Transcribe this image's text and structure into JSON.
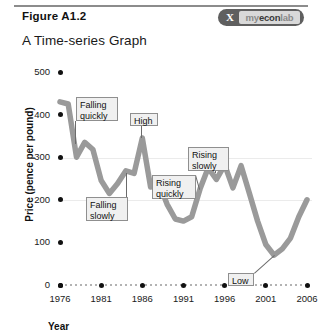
{
  "header": {
    "figure_label": "Figure A1.2",
    "title": "A Time-series Graph",
    "logo_mark": "X",
    "logo_text_a": "my",
    "logo_text_b": "econ",
    "logo_text_c": "lab"
  },
  "colors": {
    "line": "#9a9a9a",
    "callout_bg": "#f0f0f0",
    "callout_border": "#8f8f8f",
    "tick": "#111111",
    "logo_pill": "#5f5f5f"
  },
  "chart_data": {
    "type": "line",
    "title": "A Time-series Graph",
    "xlabel": "Year",
    "ylabel": "Price (pence per pound)",
    "xlim": [
      1976,
      2006
    ],
    "ylim": [
      0,
      500
    ],
    "xticks": [
      1976,
      1981,
      1986,
      1991,
      1996,
      2001,
      2006
    ],
    "yticks": [
      0,
      100,
      200,
      300,
      400,
      500
    ],
    "grid": false,
    "legend": null,
    "series": [
      {
        "name": "Price of coffee",
        "x": [
          1976,
          1977,
          1978,
          1979,
          1980,
          1981,
          1982,
          1983,
          1984,
          1985,
          1986,
          1987,
          1988,
          1989,
          1990,
          1991,
          1992,
          1993,
          1994,
          1995,
          1996,
          1997,
          1998,
          1999,
          2000,
          2001,
          2002,
          2003,
          2004,
          2005,
          2006
        ],
        "values": [
          430,
          425,
          300,
          335,
          318,
          245,
          215,
          238,
          268,
          262,
          345,
          230,
          240,
          190,
          155,
          150,
          160,
          225,
          275,
          248,
          282,
          228,
          280,
          215,
          150,
          95,
          70,
          85,
          110,
          160,
          200
        ]
      }
    ],
    "annotations": [
      {
        "id": "falling-quickly",
        "text_line1": "Falling",
        "text_line2": "quickly",
        "points_to_year": 1978,
        "points_to_value": 330
      },
      {
        "id": "falling-slowly",
        "text_line1": "Falling",
        "text_line2": "slowly",
        "points_to_year": 1984,
        "points_to_value": 262
      },
      {
        "id": "high",
        "text_line1": "High",
        "text_line2": "",
        "points_to_year": 1986,
        "points_to_value": 345
      },
      {
        "id": "rising-quickly",
        "text_line1": "Rising",
        "text_line2": "quickly",
        "points_to_year": 1993,
        "points_to_value": 225
      },
      {
        "id": "rising-slowly",
        "text_line1": "Rising",
        "text_line2": "slowly",
        "points_to_year": 1995,
        "points_to_value": 262
      },
      {
        "id": "low",
        "text_line1": "Low",
        "text_line2": "",
        "points_to_year": 2002,
        "points_to_value": 70
      }
    ]
  }
}
